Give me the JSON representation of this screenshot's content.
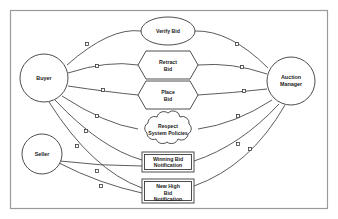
{
  "diagram": {
    "type": "uml-use-case",
    "frame": {
      "x": 10,
      "y": 10,
      "width": 318,
      "height": 199
    },
    "colors": {
      "background": "#ffffff",
      "frame_stroke": "#9a9a9a",
      "node_stroke": "#3a3a3a",
      "edge_stroke": "#4a4a4a",
      "label_fill": "#1a1a1a"
    },
    "actors": [
      {
        "id": "buyer",
        "label": "Buyer",
        "shape": "circle",
        "cx": 44,
        "cy": 78,
        "r": 24,
        "font_size": 5.4
      },
      {
        "id": "seller",
        "label": "Seller",
        "shape": "circle",
        "cx": 42,
        "cy": 154,
        "r": 20,
        "font_size": 5.4
      },
      {
        "id": "auction-manager",
        "label_line1": "Auction",
        "label_line2": "Manager",
        "shape": "circle",
        "cx": 291,
        "cy": 81,
        "r": 24,
        "font_size": 5.4
      }
    ],
    "use_cases": [
      {
        "id": "verify-bid",
        "label_line1": "Verify Bid",
        "label_line2": "",
        "shape": "ellipse",
        "cx": 168,
        "cy": 31,
        "rx": 27,
        "ry": 14,
        "font_size": 5.2
      },
      {
        "id": "retract-bid",
        "label_line1": "Retract",
        "label_line2": "Bid",
        "shape": "hexagon",
        "cx": 168,
        "cy": 65,
        "rx": 30,
        "ry": 14,
        "font_size": 5.2
      },
      {
        "id": "place-bid",
        "label_line1": "Place",
        "label_line2": "Bid",
        "shape": "hexagon",
        "cx": 168,
        "cy": 95,
        "rx": 30,
        "ry": 14,
        "font_size": 5.2
      },
      {
        "id": "respect-system-policies",
        "label_line1": "Respect",
        "label_line2": "System Policies",
        "shape": "cloud",
        "cx": 168,
        "cy": 129,
        "rx": 31,
        "ry": 14,
        "font_size": 5.2
      },
      {
        "id": "winning-bid-notification",
        "label_line1": "Winning Bid",
        "label_line2": "Notification",
        "label_line3": "",
        "shape": "double-rect",
        "x": 142,
        "y": 152,
        "width": 52,
        "height": 20,
        "font_size": 5.2
      },
      {
        "id": "new-high-bid-notification",
        "label_line1": "New High",
        "label_line2": "Bid",
        "label_line3": "Notification",
        "shape": "double-rect",
        "x": 142,
        "y": 179,
        "width": 52,
        "height": 24,
        "font_size": 5.2
      }
    ],
    "associations": [
      {
        "id": "buyer-verify-bid",
        "from": "buyer",
        "to": "verify-bid",
        "marker": true
      },
      {
        "id": "buyer-retract-bid",
        "from": "buyer",
        "to": "retract-bid",
        "marker": true
      },
      {
        "id": "buyer-place-bid",
        "from": "buyer",
        "to": "place-bid",
        "marker": true
      },
      {
        "id": "buyer-respect-policies",
        "from": "buyer",
        "to": "respect-system-policies",
        "marker": true
      },
      {
        "id": "buyer-winning-bid",
        "from": "buyer",
        "to": "winning-bid-notification",
        "marker": true
      },
      {
        "id": "buyer-new-high-bid",
        "from": "buyer",
        "to": "new-high-bid-notification",
        "marker": true
      },
      {
        "id": "seller-winning-bid",
        "from": "seller",
        "to": "winning-bid-notification",
        "marker": true
      },
      {
        "id": "seller-new-high-bid",
        "from": "seller",
        "to": "new-high-bid-notification",
        "marker": true
      },
      {
        "id": "manager-verify-bid",
        "from": "auction-manager",
        "to": "verify-bid",
        "marker": true
      },
      {
        "id": "manager-retract-bid",
        "from": "auction-manager",
        "to": "retract-bid",
        "marker": true
      },
      {
        "id": "manager-place-bid",
        "from": "auction-manager",
        "to": "place-bid",
        "marker": true
      },
      {
        "id": "manager-respect-policies",
        "from": "auction-manager",
        "to": "respect-system-policies",
        "marker": true
      },
      {
        "id": "manager-winning-bid",
        "from": "auction-manager",
        "to": "winning-bid-notification",
        "marker": true
      },
      {
        "id": "manager-new-high-bid",
        "from": "auction-manager",
        "to": "new-high-bid-notification",
        "marker": true
      }
    ]
  }
}
